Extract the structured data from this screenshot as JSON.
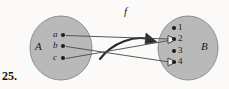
{
  "exercise": {
    "number": "25."
  },
  "figure": {
    "function_label": "f",
    "left_set": {
      "name": "A",
      "elements": [
        {
          "label": "a",
          "x": 63,
          "y": 35
        },
        {
          "label": "b",
          "x": 63,
          "y": 46
        },
        {
          "label": "c",
          "x": 63,
          "y": 58
        }
      ]
    },
    "right_set": {
      "name": "B",
      "elements": [
        {
          "label": "1",
          "x": 178,
          "y": 28
        },
        {
          "label": "2",
          "x": 178,
          "y": 39
        },
        {
          "label": "3",
          "x": 178,
          "y": 51
        },
        {
          "label": "4",
          "x": 178,
          "y": 62
        }
      ]
    },
    "mappings": [
      {
        "from": "a",
        "to": "2"
      },
      {
        "from": "b",
        "to": "4"
      },
      {
        "from": "c",
        "to": "2"
      }
    ]
  },
  "colors": {
    "set_fill": "#b9b9b9",
    "set_stroke": "#8a8a8a",
    "line": "#3c3c3c",
    "dot": "#1f1f1f",
    "background": "#fbfaf8",
    "text": "#1a1a1a"
  }
}
